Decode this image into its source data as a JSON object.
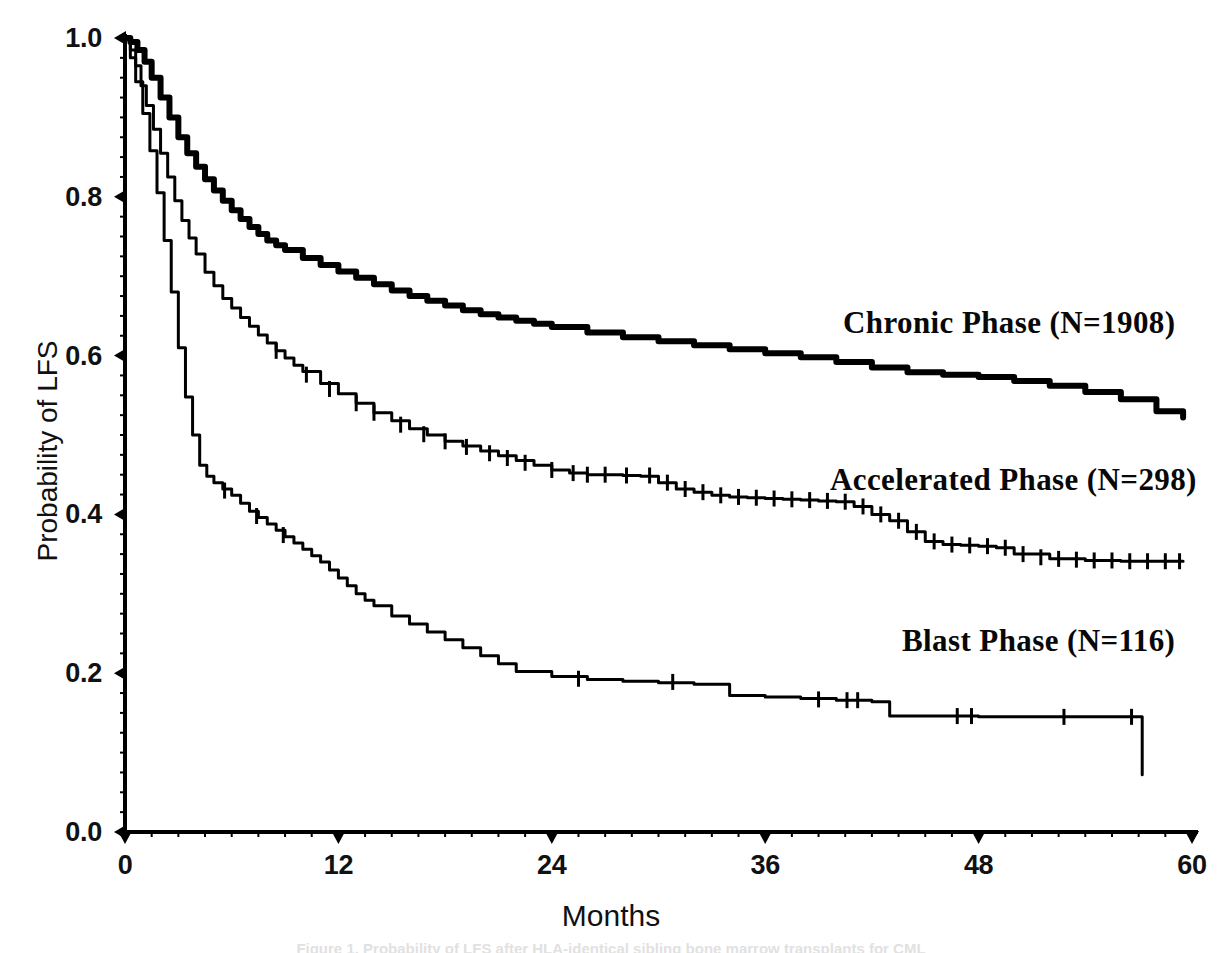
{
  "figure": {
    "background_color": "#ffffff",
    "ink_color": "#000000",
    "width": 1222,
    "height": 953,
    "footer_partial_text": "Figure 1. Probability of LFS after HLA-identical sibling bone marrow transplants for CML"
  },
  "axes": {
    "y_title": "Probability of LFS",
    "x_title": "Months",
    "y_ticks": [
      "0.0",
      "0.2",
      "0.4",
      "0.6",
      "0.8",
      "1.0"
    ],
    "x_ticks": [
      "0",
      "12",
      "24",
      "36",
      "48",
      "60"
    ]
  },
  "annotations": [
    {
      "name": "chronic-phase-label",
      "text": "Chronic Phase (N=1908)",
      "x": 843,
      "y": 305
    },
    {
      "name": "accelerated-phase-label",
      "text": "Accelerated Phase (N=298)",
      "x": 830,
      "y": 462
    },
    {
      "name": "blast-phase-label",
      "text": "Blast Phase (N=116)",
      "x": 902,
      "y": 623
    }
  ],
  "chart_data": {
    "type": "line",
    "subtype": "kaplan-meier-survival",
    "title": "",
    "xlabel": "Months",
    "ylabel": "Probability of LFS",
    "xlim": [
      0,
      60
    ],
    "ylim": [
      0.0,
      1.0
    ],
    "xticks": [
      0,
      12,
      24,
      36,
      48,
      60
    ],
    "yticks": [
      0.0,
      0.2,
      0.4,
      0.6,
      0.8,
      1.0
    ],
    "grid": false,
    "legend_position": "inline-annotations",
    "censor_marks": true,
    "series": [
      {
        "name": "Chronic Phase",
        "n": 1908,
        "label": "Chronic Phase (N=1908)",
        "line_width": 6,
        "x": [
          0,
          0.3,
          0.7,
          1.1,
          1.5,
          2.0,
          2.5,
          3.0,
          3.5,
          4.0,
          4.5,
          5.0,
          5.5,
          6.0,
          6.5,
          7.0,
          7.5,
          8.0,
          8.5,
          9.0,
          10.0,
          11.0,
          12.0,
          13.0,
          14.0,
          15.0,
          16.0,
          17.0,
          18.0,
          19.0,
          20.0,
          21.0,
          22.0,
          23.0,
          24.0,
          26.0,
          28.0,
          30.0,
          32.0,
          34.0,
          36.0,
          38.0,
          40.0,
          42.0,
          44.0,
          46.0,
          48.0,
          50.0,
          52.0,
          54.0,
          56.0,
          58.0,
          59.5
        ],
        "y": [
          1.0,
          0.995,
          0.985,
          0.97,
          0.95,
          0.925,
          0.9,
          0.875,
          0.855,
          0.838,
          0.822,
          0.808,
          0.795,
          0.783,
          0.772,
          0.762,
          0.753,
          0.745,
          0.739,
          0.733,
          0.723,
          0.714,
          0.706,
          0.698,
          0.69,
          0.682,
          0.675,
          0.669,
          0.663,
          0.657,
          0.652,
          0.648,
          0.644,
          0.64,
          0.636,
          0.629,
          0.623,
          0.618,
          0.613,
          0.608,
          0.603,
          0.598,
          0.592,
          0.585,
          0.579,
          0.576,
          0.573,
          0.568,
          0.562,
          0.554,
          0.545,
          0.53,
          0.522
        ],
        "censor_x": [],
        "censor_y": []
      },
      {
        "name": "Accelerated Phase",
        "n": 298,
        "label": "Accelerated Phase (N=298)",
        "line_width": 3,
        "x": [
          0,
          0.3,
          0.6,
          0.9,
          1.2,
          1.6,
          2.0,
          2.4,
          2.8,
          3.2,
          3.6,
          4.0,
          4.5,
          5.0,
          5.5,
          6.0,
          6.5,
          7.0,
          7.5,
          8.0,
          8.5,
          9.0,
          9.5,
          10.0,
          11.0,
          12.0,
          13.0,
          14.0,
          15.0,
          16.0,
          17.0,
          18.0,
          19.0,
          20.0,
          21.0,
          22.0,
          23.0,
          24.0,
          25.0,
          26.0,
          27.0,
          28.0,
          29.0,
          30.0,
          31.0,
          32.0,
          33.0,
          34.0,
          35.0,
          36.0,
          37.0,
          38.0,
          39.0,
          40.0,
          41.0,
          42.0,
          43.0,
          44.0,
          45.0,
          46.0,
          47.0,
          48.0,
          49.0,
          50.0,
          52.0,
          54.0,
          56.0,
          58.0,
          59.5
        ],
        "y": [
          1.0,
          0.985,
          0.965,
          0.94,
          0.915,
          0.885,
          0.855,
          0.825,
          0.795,
          0.77,
          0.748,
          0.728,
          0.705,
          0.688,
          0.672,
          0.66,
          0.648,
          0.637,
          0.626,
          0.616,
          0.606,
          0.597,
          0.588,
          0.58,
          0.565,
          0.552,
          0.54,
          0.528,
          0.518,
          0.508,
          0.5,
          0.492,
          0.486,
          0.48,
          0.474,
          0.468,
          0.462,
          0.456,
          0.452,
          0.45,
          0.45,
          0.449,
          0.448,
          0.44,
          0.432,
          0.428,
          0.424,
          0.422,
          0.421,
          0.42,
          0.419,
          0.418,
          0.417,
          0.416,
          0.41,
          0.4,
          0.392,
          0.378,
          0.366,
          0.362,
          0.361,
          0.36,
          0.358,
          0.35,
          0.344,
          0.342,
          0.341,
          0.341,
          0.341
        ],
        "censor_x": [
          8.5,
          10.2,
          11.5,
          13.0,
          14.0,
          15.5,
          16.8,
          18.0,
          19.2,
          20.5,
          21.5,
          22.5,
          24.0,
          25.2,
          26.0,
          27.0,
          28.2,
          29.5,
          30.5,
          31.5,
          32.5,
          33.5,
          34.5,
          35.5,
          36.5,
          37.5,
          38.5,
          39.5,
          40.5,
          41.5,
          42.5,
          43.5,
          44.5,
          45.5,
          46.5,
          47.5,
          48.5,
          49.5,
          50.5,
          51.5,
          52.5,
          53.5,
          54.5,
          55.5,
          56.5,
          57.5,
          58.5,
          59.3
        ],
        "censor_y": [
          0.606,
          0.576,
          0.558,
          0.54,
          0.528,
          0.513,
          0.501,
          0.492,
          0.485,
          0.477,
          0.471,
          0.465,
          0.456,
          0.452,
          0.45,
          0.45,
          0.449,
          0.449,
          0.44,
          0.432,
          0.428,
          0.424,
          0.422,
          0.421,
          0.42,
          0.419,
          0.418,
          0.417,
          0.416,
          0.41,
          0.4,
          0.392,
          0.378,
          0.366,
          0.362,
          0.361,
          0.36,
          0.358,
          0.35,
          0.346,
          0.344,
          0.343,
          0.342,
          0.342,
          0.341,
          0.341,
          0.341,
          0.341
        ]
      },
      {
        "name": "Blast Phase",
        "n": 116,
        "label": "Blast Phase (N=116)",
        "line_width": 3,
        "x": [
          0,
          0.3,
          0.6,
          1.0,
          1.4,
          1.8,
          2.2,
          2.6,
          3.0,
          3.4,
          3.8,
          4.2,
          4.6,
          5.0,
          5.5,
          6.0,
          6.5,
          7.0,
          7.5,
          8.0,
          8.5,
          9.0,
          9.5,
          10.0,
          10.5,
          11.0,
          11.5,
          12.0,
          12.5,
          13.0,
          13.5,
          14.0,
          15.0,
          16.0,
          17.0,
          18.0,
          19.0,
          20.0,
          21.0,
          22.0,
          24.0,
          26.0,
          28.0,
          30.0,
          32.0,
          34.0,
          36.0,
          38.0,
          40.0,
          42.0,
          43.0,
          45.0,
          48.0,
          52.0,
          56.0,
          57.0,
          57.2
        ],
        "y": [
          1.0,
          0.975,
          0.945,
          0.905,
          0.858,
          0.805,
          0.745,
          0.68,
          0.61,
          0.548,
          0.5,
          0.462,
          0.448,
          0.44,
          0.432,
          0.424,
          0.414,
          0.404,
          0.396,
          0.388,
          0.38,
          0.372,
          0.364,
          0.356,
          0.348,
          0.34,
          0.33,
          0.32,
          0.31,
          0.3,
          0.292,
          0.285,
          0.272,
          0.262,
          0.252,
          0.242,
          0.232,
          0.222,
          0.212,
          0.202,
          0.196,
          0.192,
          0.19,
          0.188,
          0.186,
          0.172,
          0.17,
          0.168,
          0.166,
          0.164,
          0.146,
          0.146,
          0.145,
          0.145,
          0.145,
          0.145,
          0.072
        ],
        "censor_x": [
          5.6,
          7.4,
          8.9,
          25.5,
          30.8,
          39.0,
          40.6,
          41.2,
          46.8,
          47.6,
          52.8,
          56.6
        ],
        "censor_y": [
          0.43,
          0.398,
          0.374,
          0.193,
          0.189,
          0.167,
          0.166,
          0.166,
          0.146,
          0.146,
          0.145,
          0.145
        ]
      }
    ]
  }
}
